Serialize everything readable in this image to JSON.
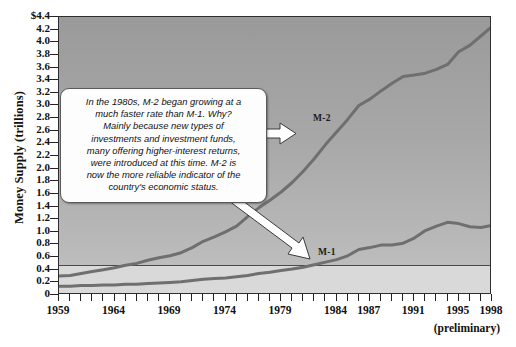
{
  "chart_data": {
    "type": "line",
    "title": "",
    "xlabel": "",
    "ylabel": "Money Supply (trillions)",
    "xlim": [
      1959,
      1998
    ],
    "ylim": [
      0,
      4.4
    ],
    "grid": false,
    "legend_position": "inline-labels",
    "x_tick_labels": [
      "1959",
      "1964",
      "1969",
      "1974",
      "1979",
      "1984",
      "1987",
      "1991",
      "1995",
      "1998"
    ],
    "x_tick_values": [
      1959,
      1964,
      1969,
      1974,
      1979,
      1984,
      1987,
      1991,
      1995,
      1998
    ],
    "y_tick_labels": [
      "$4.4",
      "4.2",
      "4.0",
      "3.8",
      "3.6",
      "3.4",
      "3.2",
      "3.0",
      "2.8",
      "2.6",
      "2.4",
      "2.2",
      "2.0",
      "1.8",
      "1.6",
      "1.4",
      "1.2",
      "1.0",
      "0.8",
      "0.6",
      "0.4",
      "0.2",
      "0"
    ],
    "y_tick_values": [
      4.4,
      4.2,
      4.0,
      3.8,
      3.6,
      3.4,
      3.2,
      3.0,
      2.8,
      2.6,
      2.4,
      2.2,
      2.0,
      1.8,
      1.6,
      1.4,
      1.2,
      1.0,
      0.8,
      0.6,
      0.4,
      0.2,
      0
    ],
    "x": [
      1959,
      1960,
      1961,
      1962,
      1963,
      1964,
      1965,
      1966,
      1967,
      1968,
      1969,
      1970,
      1971,
      1972,
      1973,
      1974,
      1975,
      1976,
      1977,
      1978,
      1979,
      1980,
      1981,
      1982,
      1983,
      1984,
      1985,
      1986,
      1987,
      1988,
      1989,
      1990,
      1991,
      1992,
      1993,
      1994,
      1995,
      1996,
      1997,
      1998
    ],
    "series": [
      {
        "name": "M-2",
        "color": "#6f6f6f",
        "label": "M-2",
        "values": [
          0.3,
          0.31,
          0.34,
          0.37,
          0.4,
          0.43,
          0.47,
          0.5,
          0.55,
          0.59,
          0.62,
          0.67,
          0.75,
          0.85,
          0.92,
          1.0,
          1.09,
          1.24,
          1.38,
          1.5,
          1.63,
          1.78,
          1.96,
          2.16,
          2.38,
          2.58,
          2.78,
          3.0,
          3.1,
          3.23,
          3.35,
          3.46,
          3.48,
          3.51,
          3.57,
          3.65,
          3.85,
          3.95,
          4.1,
          4.25
        ]
      },
      {
        "name": "M-1",
        "color": "#6f6f6f",
        "label": "M-1",
        "values": [
          0.14,
          0.14,
          0.15,
          0.15,
          0.16,
          0.16,
          0.17,
          0.17,
          0.18,
          0.19,
          0.2,
          0.21,
          0.23,
          0.25,
          0.26,
          0.27,
          0.29,
          0.31,
          0.34,
          0.36,
          0.39,
          0.41,
          0.44,
          0.48,
          0.52,
          0.56,
          0.62,
          0.72,
          0.75,
          0.79,
          0.79,
          0.82,
          0.9,
          1.02,
          1.09,
          1.15,
          1.13,
          1.08,
          1.07,
          1.1
        ]
      }
    ],
    "annotations": [
      {
        "name": "callout",
        "text": "In the 1980s, M-2 began growing at a much faster rate than M-1. Why? Mainly because new types of investments and investment funds, many offering higher-interest returns, were introduced at this time. M-2 is now the more reliable indicator of the country's economic status.",
        "lines": [
          "In the 1980s, M-2 began growing at a",
          "much faster rate than M-1. Why?",
          "Mainly because new types of",
          "investments and investment funds,",
          "many offering higher-interest returns,",
          "were introduced at this time. M-2 is",
          "now the more reliable indicator of the",
          "country's economic status."
        ],
        "arrows": [
          "to-M-2",
          "to-M-1"
        ]
      },
      {
        "name": "preliminary-note",
        "text": "(preliminary)"
      }
    ],
    "colors": {
      "plot_background_top": "#9a9a9a",
      "plot_background_bottom": "#c3c3c3",
      "low_band": "#d9d9d9",
      "line": "#6f6f6f",
      "frame": "#2e2e2e",
      "callout_background": "#fdfdfd",
      "callout_border": "#5a5a5a"
    }
  }
}
